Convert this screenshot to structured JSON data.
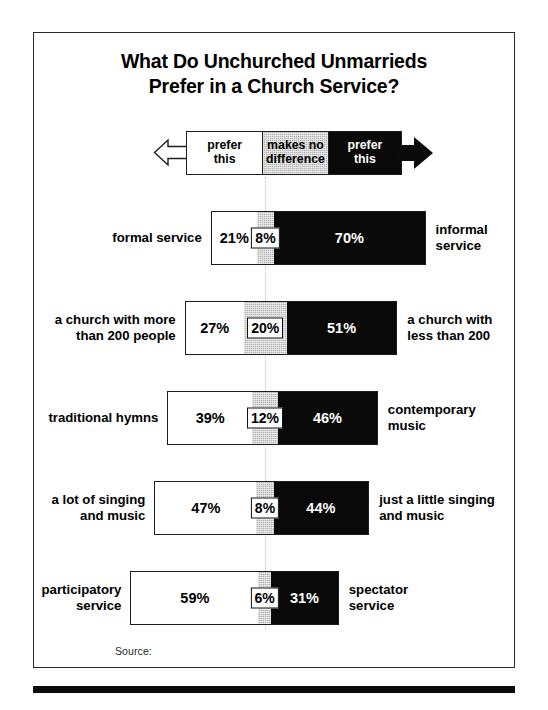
{
  "title": {
    "line1": "What Do Unchurched Unmarrieds",
    "line2": "Prefer in a Church Service?"
  },
  "legend": {
    "left_label_line1": "prefer",
    "left_label_line2": "this",
    "middle_label_line1": "makes no",
    "middle_label_line2": "difference",
    "right_label_line1": "prefer",
    "right_label_line2": "this",
    "left_arrow_icon": "left-arrow-outline-icon",
    "right_arrow_icon": "right-arrow-solid-icon"
  },
  "source": {
    "label": "Source:"
  },
  "colors": {
    "left_segment": "#ffffff",
    "middle_segment": "#b4b4b4",
    "right_segment": "#090909",
    "frame": "#2b2b2b",
    "centerline": "#c2c2c2"
  },
  "chart_data": {
    "type": "bar",
    "subtype": "diverging-stacked-bar",
    "title": "What Do Unchurched Unmarrieds Prefer in a Church Service?",
    "xlabel": "",
    "ylabel": "",
    "xlim": [
      0,
      100
    ],
    "grid": false,
    "legend_position": "top",
    "units": "percent",
    "legend_entries": [
      "prefer this (left)",
      "makes no difference",
      "prefer this (right)"
    ],
    "series": [
      {
        "name": "prefer this (left)",
        "values": [
          21,
          27,
          39,
          47,
          59
        ]
      },
      {
        "name": "makes no difference",
        "values": [
          8,
          20,
          12,
          8,
          6
        ]
      },
      {
        "name": "prefer this (right)",
        "values": [
          70,
          51,
          46,
          44,
          31
        ]
      }
    ],
    "categories": [
      "formal service vs informal service",
      "a church with more than 200 people vs a church with less than 200",
      "traditional hymns vs contemporary music",
      "a lot of singing and music vs just a little singing and music",
      "participatory service vs spectator service"
    ],
    "rows": [
      {
        "left_label": "formal service",
        "right_label": "informal service",
        "left_value": 21,
        "middle_value": 8,
        "right_value": 70,
        "left_text": "21%",
        "middle_text": "8%",
        "right_text": "70%"
      },
      {
        "left_label": "a church with more\nthan 200 people",
        "left_label_line1": "a church with more",
        "left_label_line2": "than 200 people",
        "right_label_line1": "a church with",
        "right_label_line2": "less than 200",
        "left_value": 27,
        "middle_value": 20,
        "right_value": 51,
        "left_text": "27%",
        "middle_text": "20%",
        "right_text": "51%"
      },
      {
        "left_label": "traditional hymns",
        "right_label_line1": "contemporary",
        "right_label_line2": "music",
        "left_value": 39,
        "middle_value": 12,
        "right_value": 46,
        "left_text": "39%",
        "middle_text": "12%",
        "right_text": "46%"
      },
      {
        "left_label_line1": "a lot of singing",
        "left_label_line2": "and music",
        "right_label_line1": "just a little singing",
        "right_label_line2": "and music",
        "left_value": 47,
        "middle_value": 8,
        "right_value": 44,
        "left_text": "47%",
        "middle_text": "8%",
        "right_text": "44%"
      },
      {
        "left_label_line1": "participatory",
        "left_label_line2": "service",
        "right_label_line1": "spectator",
        "right_label_line2": "service",
        "left_value": 59,
        "middle_value": 6,
        "right_value": 31,
        "left_text": "59%",
        "middle_text": "6%",
        "right_text": "31%"
      }
    ]
  }
}
